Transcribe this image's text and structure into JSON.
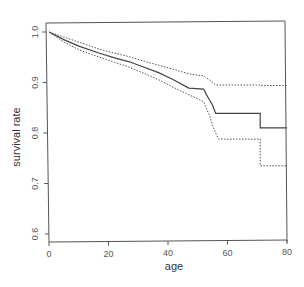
{
  "chart_data": {
    "type": "line",
    "title": "",
    "xlabel": "age",
    "ylabel": "survival rate",
    "xlim": [
      0,
      80
    ],
    "ylim": [
      0.6,
      1.0
    ],
    "x_ticks": [
      0,
      20,
      40,
      60,
      80
    ],
    "x_tick_labels": [
      "0",
      "20",
      "40",
      "60",
      "80"
    ],
    "y_ticks": [
      0.6,
      0.7,
      0.8,
      0.9,
      1.0
    ],
    "y_tick_labels": [
      "0.6",
      "0.7",
      "0.8",
      "0.9",
      "1.0"
    ],
    "grid": false,
    "legend": null,
    "series": [
      {
        "name": "survival estimate",
        "style": "solid",
        "color": "#444444",
        "points": [
          [
            0,
            1.0
          ],
          [
            5,
            0.985
          ],
          [
            10,
            0.972
          ],
          [
            17,
            0.958
          ],
          [
            22,
            0.949
          ],
          [
            27,
            0.941
          ],
          [
            32,
            0.93
          ],
          [
            37,
            0.919
          ],
          [
            42,
            0.905
          ],
          [
            47,
            0.889
          ],
          [
            52,
            0.887
          ],
          [
            53,
            0.875
          ],
          [
            54,
            0.865
          ],
          [
            55,
            0.855
          ],
          [
            56,
            0.839
          ],
          [
            71,
            0.839
          ],
          [
            71,
            0.81
          ],
          [
            80,
            0.81
          ]
        ]
      },
      {
        "name": "upper confidence bound",
        "style": "dotted",
        "color": "#555555",
        "points": [
          [
            0,
            1.0
          ],
          [
            5,
            0.99
          ],
          [
            10,
            0.98
          ],
          [
            17,
            0.966
          ],
          [
            22,
            0.958
          ],
          [
            27,
            0.951
          ],
          [
            32,
            0.942
          ],
          [
            37,
            0.934
          ],
          [
            42,
            0.926
          ],
          [
            47,
            0.917
          ],
          [
            52,
            0.913
          ],
          [
            54,
            0.905
          ],
          [
            56,
            0.895
          ],
          [
            71,
            0.895
          ],
          [
            71,
            0.894
          ],
          [
            80,
            0.894
          ]
        ]
      },
      {
        "name": "lower confidence bound",
        "style": "dotted",
        "color": "#555555",
        "points": [
          [
            0,
            1.0
          ],
          [
            5,
            0.98
          ],
          [
            10,
            0.965
          ],
          [
            17,
            0.95
          ],
          [
            22,
            0.94
          ],
          [
            27,
            0.93
          ],
          [
            32,
            0.918
          ],
          [
            37,
            0.905
          ],
          [
            44,
            0.884
          ],
          [
            52,
            0.862
          ],
          [
            53,
            0.847
          ],
          [
            54,
            0.834
          ],
          [
            55,
            0.815
          ],
          [
            56,
            0.8
          ],
          [
            57,
            0.788
          ],
          [
            71,
            0.788
          ],
          [
            71,
            0.735
          ],
          [
            80,
            0.735
          ]
        ]
      }
    ]
  }
}
